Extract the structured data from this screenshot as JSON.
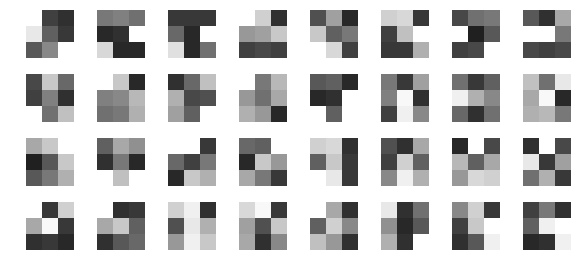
{
  "figure": {
    "background_color": "#ffffff",
    "grid_rows": 4,
    "grid_cols": 8,
    "patch_rows": 3,
    "patch_cols": 3,
    "cell_size_px": 16,
    "tile_size_px": 48,
    "col_pitch_px": 71,
    "row_pitch_px": 64,
    "origin_x_px": 26,
    "origin_y_px": 10
  },
  "chart_data": {
    "type": "heatmap",
    "title": "",
    "xlabel": "",
    "ylabel": "",
    "grid": false,
    "legend": "none",
    "colormap": "grayscale",
    "value_range": [
      0,
      255
    ],
    "null_value": "white-background",
    "note": "Each tile is a 3x3 matrix of 8-bit grayscale values; null entries are rendered as page background.",
    "tiles": [
      {
        "row": 0,
        "col": 0,
        "values": [
          [
            null,
            64,
            48
          ],
          [
            232,
            96,
            56
          ],
          [
            88,
            136,
            null
          ]
        ]
      },
      {
        "row": 0,
        "col": 1,
        "values": [
          [
            120,
            128,
            112
          ],
          [
            40,
            48,
            null
          ],
          [
            216,
            40,
            40
          ]
        ]
      },
      {
        "row": 0,
        "col": 2,
        "values": [
          [
            56,
            56,
            56
          ],
          [
            104,
            40,
            null
          ],
          [
            224,
            40,
            112
          ]
        ]
      },
      {
        "row": 0,
        "col": 3,
        "values": [
          [
            null,
            208,
            48
          ],
          [
            152,
            160,
            200
          ],
          [
            64,
            72,
            64
          ]
        ]
      },
      {
        "row": 0,
        "col": 4,
        "values": [
          [
            80,
            160,
            40
          ],
          [
            200,
            96,
            120
          ],
          [
            null,
            216,
            64
          ]
        ]
      },
      {
        "row": 0,
        "col": 5,
        "values": [
          [
            208,
            216,
            56
          ],
          [
            64,
            192,
            null
          ],
          [
            56,
            56,
            176
          ]
        ]
      },
      {
        "row": 0,
        "col": 6,
        "values": [
          [
            72,
            112,
            120
          ],
          [
            null,
            32,
            88
          ],
          [
            64,
            72,
            null
          ]
        ]
      },
      {
        "row": 0,
        "col": 7,
        "values": [
          [
            88,
            48,
            168
          ],
          [
            null,
            null,
            120
          ],
          [
            72,
            64,
            72
          ]
        ]
      }
    ],
    "tiles_row2": [
      {
        "row": 1,
        "col": 0,
        "values": [
          [
            72,
            200,
            104
          ],
          [
            64,
            128,
            48
          ],
          [
            null,
            112,
            192
          ]
        ]
      },
      {
        "row": 1,
        "col": 1,
        "values": [
          [
            null,
            200,
            40
          ],
          [
            128,
            136,
            184
          ],
          [
            112,
            120,
            176
          ]
        ]
      },
      {
        "row": 1,
        "col": 2,
        "values": [
          [
            48,
            104,
            192
          ],
          [
            176,
            72,
            80
          ],
          [
            160,
            96,
            null
          ]
        ]
      },
      {
        "row": 1,
        "col": 3,
        "values": [
          [
            null,
            120,
            184
          ],
          [
            152,
            112,
            168
          ],
          [
            176,
            152,
            40
          ]
        ]
      },
      {
        "row": 1,
        "col": 4,
        "values": [
          [
            88,
            96,
            40
          ],
          [
            40,
            48,
            null
          ],
          [
            null,
            96,
            null
          ]
        ]
      },
      {
        "row": 1,
        "col": 5,
        "values": [
          [
            120,
            56,
            160
          ],
          [
            128,
            248,
            48
          ],
          [
            64,
            240,
            136
          ]
        ]
      },
      {
        "row": 1,
        "col": 6,
        "values": [
          [
            112,
            56,
            96
          ],
          [
            240,
            176,
            136
          ],
          [
            104,
            48,
            112
          ]
        ]
      },
      {
        "row": 1,
        "col": 7,
        "values": [
          [
            192,
            112,
            232
          ],
          [
            168,
            248,
            40
          ],
          [
            176,
            184,
            120
          ]
        ]
      }
    ],
    "tiles_row3": [
      {
        "row": 2,
        "col": 0,
        "values": [
          [
            168,
            200,
            null
          ],
          [
            32,
            88,
            200
          ],
          [
            88,
            120,
            176
          ]
        ]
      },
      {
        "row": 2,
        "col": 1,
        "values": [
          [
            96,
            168,
            144
          ],
          [
            48,
            120,
            40
          ],
          [
            null,
            192,
            null
          ]
        ]
      },
      {
        "row": 2,
        "col": 2,
        "values": [
          [
            null,
            null,
            56
          ],
          [
            104,
            64,
            120
          ],
          [
            40,
            200,
            176
          ]
        ]
      },
      {
        "row": 2,
        "col": 3,
        "values": [
          [
            104,
            96,
            null
          ],
          [
            40,
            200,
            152
          ],
          [
            168,
            120,
            56
          ]
        ]
      },
      {
        "row": 2,
        "col": 4,
        "values": [
          [
            208,
            216,
            48
          ],
          [
            96,
            200,
            56
          ],
          [
            null,
            232,
            56
          ]
        ]
      },
      {
        "row": 2,
        "col": 5,
        "values": [
          [
            80,
            48,
            168
          ],
          [
            64,
            208,
            96
          ],
          [
            136,
            240,
            176
          ]
        ]
      },
      {
        "row": 2,
        "col": 6,
        "values": [
          [
            40,
            null,
            72
          ],
          [
            184,
            96,
            168
          ],
          [
            152,
            216,
            208
          ]
        ]
      },
      {
        "row": 2,
        "col": 7,
        "values": [
          [
            48,
            null,
            72
          ],
          [
            232,
            56,
            160
          ],
          [
            112,
            176,
            56
          ]
        ]
      }
    ],
    "tiles_row4": [
      {
        "row": 3,
        "col": 0,
        "values": [
          [
            null,
            56,
            208
          ],
          [
            168,
            248,
            56
          ],
          [
            48,
            56,
            40
          ]
        ]
      },
      {
        "row": 3,
        "col": 1,
        "values": [
          [
            null,
            48,
            56
          ],
          [
            168,
            200,
            96
          ],
          [
            48,
            88,
            104
          ]
        ]
      },
      {
        "row": 3,
        "col": 2,
        "values": [
          [
            208,
            240,
            48
          ],
          [
            80,
            232,
            176
          ],
          [
            152,
            240,
            200
          ]
        ]
      },
      {
        "row": 3,
        "col": 3,
        "values": [
          [
            216,
            248,
            56
          ],
          [
            160,
            80,
            200
          ],
          [
            168,
            48,
            136
          ]
        ]
      },
      {
        "row": 3,
        "col": 4,
        "values": [
          [
            null,
            168,
            48
          ],
          [
            96,
            208,
            136
          ],
          [
            192,
            152,
            48
          ]
        ]
      },
      {
        "row": 3,
        "col": 5,
        "values": [
          [
            232,
            48,
            112
          ],
          [
            144,
            40,
            88
          ],
          [
            176,
            48,
            null
          ]
        ]
      },
      {
        "row": 3,
        "col": 6,
        "values": [
          [
            136,
            208,
            56
          ],
          [
            64,
            200,
            null
          ],
          [
            48,
            88,
            240
          ]
        ]
      },
      {
        "row": 3,
        "col": 7,
        "values": [
          [
            64,
            120,
            48
          ],
          [
            96,
            240,
            null
          ],
          [
            40,
            48,
            240
          ]
        ]
      }
    ]
  }
}
